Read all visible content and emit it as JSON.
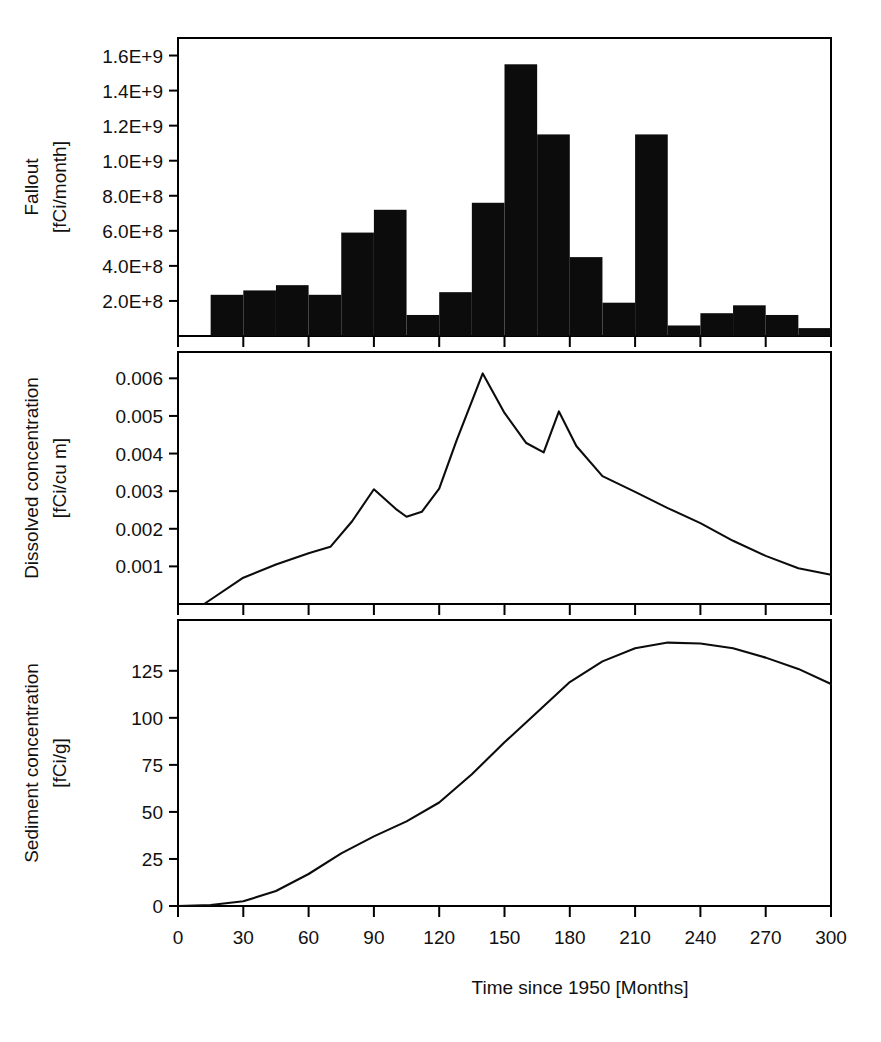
{
  "figure": {
    "background": "#ffffff",
    "ink_color": "#0c0c0c",
    "xlabel": "Time since 1950 [Months]",
    "x_ticks": [
      "0",
      "30",
      "60",
      "90",
      "120",
      "150",
      "180",
      "210",
      "240",
      "270",
      "300"
    ],
    "xlim": [
      0,
      300
    ]
  },
  "chart_data": [
    {
      "type": "bar",
      "panel": "top",
      "title": "",
      "ylabel_line1": "Fallout",
      "ylabel_line2": "[fCi/month]",
      "xlabel": "",
      "xlim": [
        0,
        300
      ],
      "ylim": [
        0,
        1700000000
      ],
      "grid": false,
      "legend": "none",
      "bar_width_months": 15,
      "y_ticks": [
        "2.0E+8",
        "4.0E+8",
        "6.0E+8",
        "8.0E+8",
        "1.0E+9",
        "1.2E+9",
        "1.4E+9",
        "1.6E+9"
      ],
      "y_tick_values": [
        200000000,
        400000000,
        600000000,
        800000000,
        1000000000,
        1200000000,
        1400000000,
        1600000000
      ],
      "x": [
        0,
        15,
        30,
        45,
        60,
        75,
        90,
        105,
        120,
        135,
        150,
        165,
        180,
        195,
        210,
        225,
        240,
        255,
        270,
        285
      ],
      "values": [
        0,
        235000000,
        260000000,
        290000000,
        235000000,
        590000000,
        720000000,
        120000000,
        250000000,
        760000000,
        1550000000,
        1150000000,
        450000000,
        190000000,
        1150000000,
        60000000,
        130000000,
        175000000,
        120000000,
        45000000
      ]
    },
    {
      "type": "line",
      "panel": "middle",
      "title": "",
      "ylabel_line1": "Dissolved concentration",
      "ylabel_line2": "[fCi/cu m]",
      "xlabel": "",
      "xlim": [
        0,
        300
      ],
      "ylim": [
        0,
        0.0067
      ],
      "grid": false,
      "legend": "none",
      "y_ticks": [
        "0.001",
        "0.002",
        "0.003",
        "0.004",
        "0.005",
        "0.006"
      ],
      "y_tick_values": [
        0.001,
        0.002,
        0.003,
        0.004,
        0.005,
        0.006
      ],
      "x": [
        12,
        30,
        45,
        60,
        70,
        80,
        90,
        100,
        105,
        112,
        120,
        128,
        140,
        150,
        160,
        168,
        175,
        183,
        195,
        210,
        225,
        240,
        255,
        270,
        285,
        300
      ],
      "values": [
        0.0,
        0.0007,
        0.00105,
        0.00135,
        0.00152,
        0.0022,
        0.00305,
        0.00253,
        0.00232,
        0.00245,
        0.00307,
        0.00435,
        0.00613,
        0.00508,
        0.00428,
        0.00403,
        0.00512,
        0.0042,
        0.0034,
        0.00298,
        0.00255,
        0.00215,
        0.00168,
        0.00128,
        0.00095,
        0.00078
      ]
    },
    {
      "type": "line",
      "panel": "bottom",
      "title": "",
      "ylabel_line1": "Sediment concentration",
      "ylabel_line2": "[fCi/g]",
      "xlabel": "Time since 1950 [Months]",
      "xlim": [
        0,
        300
      ],
      "ylim": [
        0,
        152
      ],
      "grid": false,
      "legend": "none",
      "y_ticks": [
        "0",
        "25",
        "50",
        "75",
        "100",
        "125"
      ],
      "y_tick_values": [
        0,
        25,
        50,
        75,
        100,
        125
      ],
      "x": [
        0,
        15,
        30,
        45,
        60,
        75,
        90,
        105,
        120,
        135,
        150,
        165,
        180,
        195,
        210,
        225,
        240,
        255,
        270,
        285,
        300
      ],
      "values": [
        0,
        0.5,
        2.5,
        8,
        17,
        28,
        37,
        45,
        55,
        70,
        87,
        103,
        119,
        130,
        137,
        140,
        139.5,
        137,
        132,
        126,
        118
      ]
    }
  ]
}
